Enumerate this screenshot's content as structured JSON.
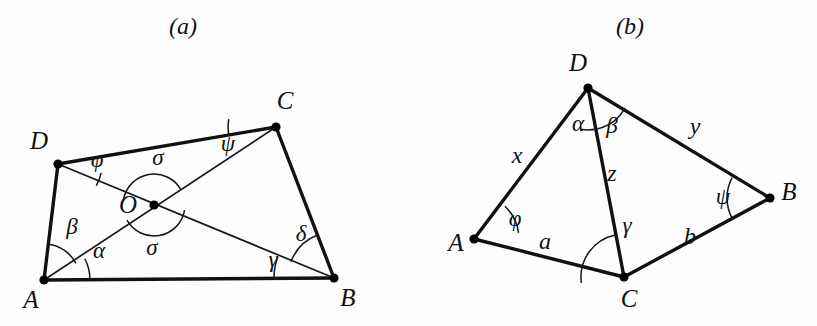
{
  "figure": {
    "background_color": "#fdfdfd",
    "stroke_color": "#111111",
    "width": 817,
    "height": 326
  },
  "panels": [
    {
      "id": "panel-a",
      "caption": "(a)",
      "caption_pos": [
        183,
        28
      ],
      "vertices": [
        {
          "name": "A",
          "point": [
            44,
            280
          ],
          "label": "A",
          "label_pos": [
            31,
            302
          ]
        },
        {
          "name": "B",
          "point": [
            334,
            278
          ],
          "label": "B",
          "label_pos": [
            348,
            300
          ]
        },
        {
          "name": "C",
          "point": [
            276,
            127
          ],
          "label": "C",
          "label_pos": [
            285,
            103
          ]
        },
        {
          "name": "D",
          "point": [
            58,
            164
          ],
          "label": "D",
          "label_pos": [
            39,
            143
          ]
        },
        {
          "name": "O",
          "point": [
            154,
            205
          ],
          "label": "O",
          "label_pos": [
            128,
            207
          ]
        }
      ],
      "edges": [
        {
          "from": "A",
          "to": "B",
          "kind": "side"
        },
        {
          "from": "B",
          "to": "C",
          "kind": "side"
        },
        {
          "from": "C",
          "to": "D",
          "kind": "side"
        },
        {
          "from": "D",
          "to": "A",
          "kind": "side"
        },
        {
          "from": "A",
          "to": "C",
          "kind": "diagonal"
        },
        {
          "from": "D",
          "to": "B",
          "kind": "diagonal"
        }
      ],
      "angle_labels": [
        {
          "symbol": "α",
          "name": "alpha",
          "pos": [
            99,
            253
          ],
          "at_vertex": "A",
          "meaning": "angle between AB and AC"
        },
        {
          "symbol": "β",
          "name": "beta",
          "pos": [
            72,
            229
          ],
          "at_vertex": "A",
          "meaning": "angle between AC and AD"
        },
        {
          "symbol": "γ",
          "name": "gamma",
          "pos": [
            273,
            262
          ],
          "at_vertex": "B",
          "meaning": "angle between BA and BD"
        },
        {
          "symbol": "δ",
          "name": "delta",
          "pos": [
            301,
            236
          ],
          "at_vertex": "B",
          "meaning": "angle between BD and BC"
        },
        {
          "symbol": "φ",
          "name": "phi",
          "pos": [
            97,
            162
          ],
          "at_vertex": "D",
          "meaning": "angle between DC and DB"
        },
        {
          "symbol": "ψ",
          "name": "psi",
          "pos": [
            228,
            146
          ],
          "at_vertex": "C",
          "meaning": "angle between CD and CA"
        },
        {
          "symbol": "σ",
          "name": "sigma-upper",
          "pos": [
            158,
            160
          ],
          "at_vertex": "O",
          "meaning": "angle at diagonal intersection, upper"
        },
        {
          "symbol": "σ",
          "name": "sigma-lower",
          "pos": [
            152,
            250
          ],
          "at_vertex": "O",
          "meaning": "angle at diagonal intersection, lower"
        }
      ],
      "angle_arcs": [
        {
          "name": "alpha-arc",
          "center": [
            44,
            280
          ],
          "radius": 46,
          "start_deg": -0.4,
          "end_deg": -27.5
        },
        {
          "name": "beta-arc",
          "center": [
            44,
            280
          ],
          "radius": 36,
          "start_deg": -27.5,
          "end_deg": -83.2
        },
        {
          "name": "gamma-arc",
          "center": [
            334,
            278
          ],
          "radius": 60,
          "start_deg": 180.4,
          "end_deg": 200.7
        },
        {
          "name": "delta-arc",
          "center": [
            334,
            278
          ],
          "radius": 46,
          "start_deg": 200.7,
          "end_deg": 249.0
        },
        {
          "name": "phi-arc",
          "center": [
            58,
            164
          ],
          "radius": 44,
          "start_deg": 11.6,
          "end_deg": 29.5
        },
        {
          "name": "psi-arc",
          "center": [
            276,
            127
          ],
          "radius": 48,
          "start_deg": 170.6,
          "end_deg": 189.5
        },
        {
          "name": "sigma-upper-arc",
          "center": [
            154,
            205
          ],
          "radius": 31,
          "start_deg": 189.7,
          "end_deg": 330.6
        },
        {
          "name": "sigma-lower-arc",
          "center": [
            154,
            205
          ],
          "radius": 31,
          "start_deg": 9.7,
          "end_deg": 150.6
        }
      ]
    },
    {
      "id": "panel-b",
      "caption": "(b)",
      "caption_pos": [
        630,
        28
      ],
      "vertices": [
        {
          "name": "A",
          "point": [
            474,
            239
          ],
          "label": "A",
          "label_pos": [
            456,
            245
          ]
        },
        {
          "name": "B",
          "point": [
            770,
            198
          ],
          "label": "B",
          "label_pos": [
            789,
            194
          ]
        },
        {
          "name": "C",
          "point": [
            624,
            277
          ],
          "label": "C",
          "label_pos": [
            629,
            301
          ]
        },
        {
          "name": "D",
          "point": [
            588,
            88
          ],
          "label": "D",
          "label_pos": [
            578,
            65
          ]
        }
      ],
      "edges": [
        {
          "from": "A",
          "to": "C",
          "kind": "side"
        },
        {
          "from": "C",
          "to": "B",
          "kind": "side"
        },
        {
          "from": "B",
          "to": "D",
          "kind": "side"
        },
        {
          "from": "D",
          "to": "A",
          "kind": "side"
        },
        {
          "from": "D",
          "to": "C",
          "kind": "side"
        }
      ],
      "angle_labels": [
        {
          "symbol": "α",
          "name": "alpha",
          "pos": [
            578,
            126
          ],
          "at_vertex": "D",
          "meaning": "angle ADC side of DA"
        },
        {
          "symbol": "β",
          "name": "beta",
          "pos": [
            612,
            128
          ],
          "at_vertex": "D",
          "meaning": "angle CDB side of DB"
        },
        {
          "symbol": "γ",
          "name": "gamma",
          "pos": [
            627,
            228
          ],
          "at_vertex": "C",
          "meaning": "angle at C between CA and CB through D"
        },
        {
          "symbol": "φ",
          "name": "phi",
          "pos": [
            515,
            221
          ],
          "at_vertex": "A",
          "meaning": "angle DAC"
        },
        {
          "symbol": "ψ",
          "name": "psi",
          "pos": [
            723,
            199
          ],
          "at_vertex": "B",
          "meaning": "angle DBC"
        }
      ],
      "side_labels": [
        {
          "symbol": "x",
          "name": "side-x",
          "pos": [
            517,
            157
          ],
          "edge": "A-D"
        },
        {
          "symbol": "y",
          "name": "side-y",
          "pos": [
            695,
            128
          ],
          "edge": "D-B"
        },
        {
          "symbol": "z",
          "name": "side-z",
          "pos": [
            612,
            175
          ],
          "edge": "D-C"
        },
        {
          "symbol": "a",
          "name": "side-a",
          "pos": [
            545,
            243
          ],
          "edge": "A-C"
        },
        {
          "symbol": "b",
          "name": "side-b",
          "pos": [
            690,
            238
          ],
          "edge": "C-B"
        }
      ],
      "angle_arcs": [
        {
          "name": "alpha-arc",
          "center": [
            588,
            88
          ],
          "radius": 42,
          "start_deg": 76.5,
          "end_deg": 100.8
        },
        {
          "name": "beta-arc",
          "center": [
            588,
            88
          ],
          "radius": 42,
          "start_deg": 28.4,
          "end_deg": 76.5
        },
        {
          "name": "gamma-arc",
          "center": [
            624,
            277
          ],
          "radius": 43,
          "start_deg": 172.1,
          "end_deg": 258.2
        },
        {
          "name": "phi-arc",
          "center": [
            474,
            239
          ],
          "radius": 45,
          "start_deg": -7.9,
          "end_deg": -46.7
        },
        {
          "name": "psi-arc",
          "center": [
            770,
            198
          ],
          "radius": 43,
          "start_deg": 151.4,
          "end_deg": 208.3
        }
      ]
    }
  ]
}
